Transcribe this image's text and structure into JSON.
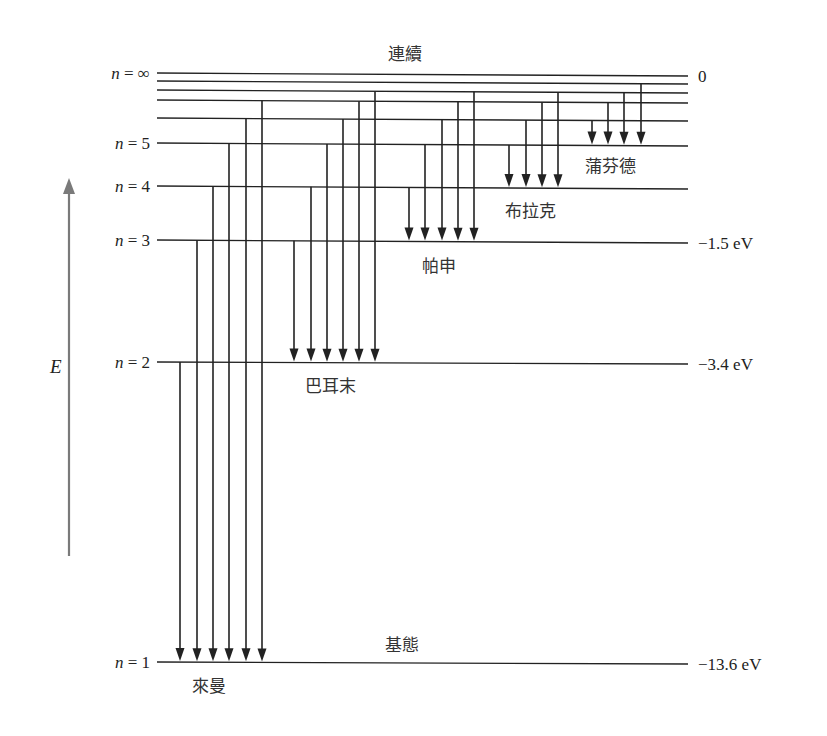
{
  "diagram": {
    "title_top": "連續",
    "ground_label": "基態",
    "axis_label": "E",
    "axis_color": "#7a7a7a",
    "line_color": "#222222",
    "levels": [
      {
        "n": "∞",
        "label": "n = ∞",
        "value": "0",
        "y_left": 73,
        "y_right": 76,
        "show_label": true
      },
      {
        "n": "9",
        "label": "",
        "value": "",
        "y_left": 81,
        "y_right": 84,
        "show_label": false
      },
      {
        "n": "8",
        "label": "",
        "value": "",
        "y_left": 90,
        "y_right": 93,
        "show_label": false
      },
      {
        "n": "7",
        "label": "",
        "value": "",
        "y_left": 100,
        "y_right": 103,
        "show_label": false
      },
      {
        "n": "6",
        "label": "",
        "value": "",
        "y_left": 118,
        "y_right": 121,
        "show_label": false
      },
      {
        "n": "5",
        "label": "n = 5",
        "value": "",
        "y_left": 143,
        "y_right": 146,
        "show_label": true
      },
      {
        "n": "4",
        "label": "n = 4",
        "value": "",
        "y_left": 186,
        "y_right": 189,
        "show_label": true
      },
      {
        "n": "3",
        "label": "n = 3",
        "value": "−1.5 eV",
        "y_left": 240,
        "y_right": 243,
        "show_label": true
      },
      {
        "n": "2",
        "label": "n = 2",
        "value": "−3.4 eV",
        "y_left": 362,
        "y_right": 364,
        "show_label": true
      },
      {
        "n": "1",
        "label": "n = 1",
        "value": "−13.6 eV",
        "y_left": 662,
        "y_right": 664,
        "show_label": true
      }
    ],
    "series": [
      {
        "name": "來曼",
        "to": "1",
        "from": [
          "2",
          "3",
          "4",
          "5",
          "6",
          "7"
        ],
        "x": [
          180,
          197,
          213,
          229,
          246,
          262
        ],
        "label_x": 192,
        "label_y": 692
      },
      {
        "name": "巴耳末",
        "to": "2",
        "from": [
          "3",
          "4",
          "5",
          "6",
          "7",
          "8"
        ],
        "x": [
          294,
          311,
          327,
          343,
          359,
          375
        ],
        "label_x": 305,
        "label_y": 392
      },
      {
        "name": "帕申",
        "to": "3",
        "from": [
          "4",
          "5",
          "6",
          "7",
          "8"
        ],
        "x": [
          409,
          425,
          442,
          458,
          474
        ],
        "label_x": 422,
        "label_y": 272
      },
      {
        "name": "布拉克",
        "to": "4",
        "from": [
          "5",
          "6",
          "7",
          "8"
        ],
        "x": [
          509,
          526,
          542,
          558
        ],
        "label_x": 505,
        "label_y": 217
      },
      {
        "name": "蒲芬德",
        "to": "5",
        "from": [
          "6",
          "7",
          "8",
          "9"
        ],
        "x": [
          592,
          608,
          624,
          641
        ],
        "label_x": 585,
        "label_y": 172
      }
    ]
  }
}
